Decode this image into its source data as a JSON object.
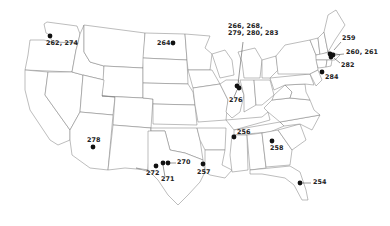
{
  "map": {
    "title": "",
    "region": "Contiguous United States",
    "marker_color": "#111111",
    "border_color": "#7a7a7a",
    "locations": [
      {
        "id": "wa",
        "label": "262, 274",
        "x": 50,
        "y": 36
      },
      {
        "id": "nd",
        "label": "264",
        "x": 173,
        "y": 43
      },
      {
        "id": "il",
        "label_top": "266, 268,",
        "label_bottom": "279, 280, 283",
        "label_below": "276",
        "x": 238,
        "y": 87
      },
      {
        "id": "nh",
        "label": "259",
        "x": 333,
        "y": 34
      },
      {
        "id": "ma",
        "label": "260, 261",
        "x": 332,
        "y": 54
      },
      {
        "id": "ri",
        "label": "282",
        "x": 333,
        "y": 65
      },
      {
        "id": "nj",
        "label": "284",
        "x": 322,
        "y": 72
      },
      {
        "id": "az",
        "label": "278",
        "x": 93,
        "y": 147
      },
      {
        "id": "tx-w",
        "label": "272",
        "x": 156,
        "y": 166
      },
      {
        "id": "tx-n1",
        "label": "271",
        "x": 163,
        "y": 163
      },
      {
        "id": "tx-n2",
        "label": "270",
        "x": 168,
        "y": 163
      },
      {
        "id": "tx-e",
        "label": "257",
        "x": 203,
        "y": 164
      },
      {
        "id": "tn",
        "label": "256",
        "x": 234,
        "y": 137
      },
      {
        "id": "ga",
        "label": "258",
        "x": 272,
        "y": 141
      },
      {
        "id": "fl",
        "label": "254",
        "x": 300,
        "y": 183
      }
    ]
  }
}
